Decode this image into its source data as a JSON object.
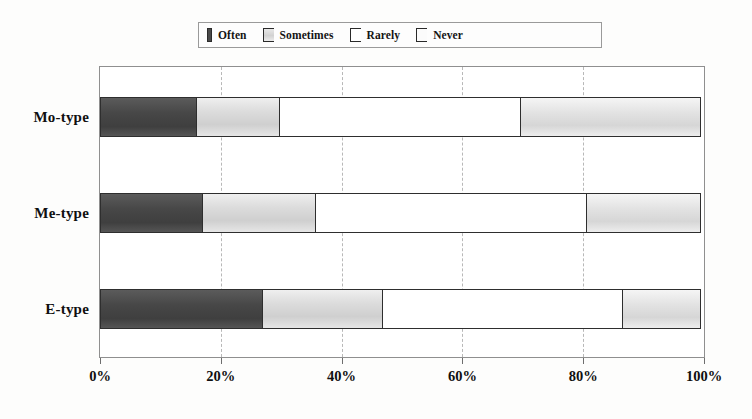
{
  "chart_data": {
    "type": "bar",
    "orientation": "horizontal",
    "stacked": true,
    "normalized": true,
    "title": "",
    "xlabel": "",
    "ylabel": "",
    "categories": [
      "Mo-type",
      "Me-type",
      "E-type"
    ],
    "series": [
      {
        "name": "Often",
        "color": "#474747",
        "values": [
          16,
          17,
          27
        ]
      },
      {
        "name": "Sometimes",
        "color": "#dcdcdc",
        "values": [
          14,
          19,
          20
        ]
      },
      {
        "name": "Rarely",
        "color": "#ffffff",
        "values": [
          40,
          45,
          40
        ]
      },
      {
        "name": "Never",
        "color": "#e2e2e2",
        "values": [
          30,
          19,
          13
        ]
      }
    ],
    "cumulative_boundaries": {
      "Mo-type": [
        16,
        30,
        70,
        100
      ],
      "Me-type": [
        17,
        36,
        81,
        100
      ],
      "E-type": [
        27,
        47,
        87,
        100
      ]
    },
    "xlim": [
      0,
      100
    ],
    "xticks": [
      0,
      20,
      40,
      60,
      80,
      100
    ],
    "xticklabels": [
      "0%",
      "20%",
      "40%",
      "60%",
      "80%",
      "100%"
    ],
    "gridlines": [
      20,
      40,
      60,
      80
    ],
    "grid": true,
    "legend_position": "top-center",
    "legend": [
      "Often",
      "Sometimes",
      "Rarely",
      "Never"
    ]
  },
  "legend": {
    "items": [
      {
        "label": "Often",
        "swatch": "legend-swatch-often"
      },
      {
        "label": "Sometimes",
        "swatch": "legend-swatch-sometimes"
      },
      {
        "label": "Rarely",
        "swatch": "legend-swatch-rarely"
      },
      {
        "label": "Never",
        "swatch": "legend-swatch-never"
      }
    ]
  },
  "axis": {
    "labels": [
      "0%",
      "20%",
      "40%",
      "60%",
      "80%",
      "100%"
    ]
  },
  "categories": {
    "labels": [
      "Mo-type",
      "Me-type",
      "E-type"
    ]
  }
}
